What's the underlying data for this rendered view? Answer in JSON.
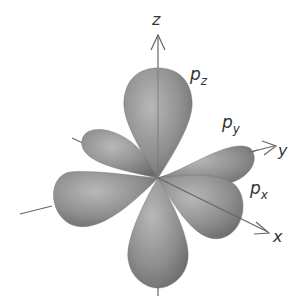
{
  "diagram": {
    "axes": {
      "z": {
        "label": "z"
      },
      "y": {
        "label": "y"
      },
      "x": {
        "label": "x"
      }
    },
    "orbitals": [
      {
        "name": "p_z",
        "base": "p",
        "sub": "z"
      },
      {
        "name": "p_y",
        "base": "p",
        "sub": "y"
      },
      {
        "name": "p_x",
        "base": "p",
        "sub": "x"
      }
    ],
    "colors": {
      "lobe_fill": "#8a8a8a",
      "lobe_light": "#b5b5b5",
      "lobe_dark": "#6e6e6e",
      "axis": "#666666",
      "text": "#333333"
    }
  }
}
